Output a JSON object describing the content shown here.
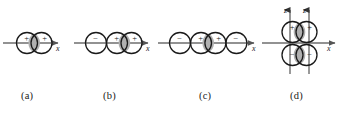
{
  "figure": {
    "background_color": "#ffffff",
    "stroke_color": "#1a1a1a",
    "axis_color": "#666666",
    "lens_fill_color": "#b3b3b3",
    "panels": [
      {
        "id": "a",
        "label": "(a)",
        "axes": [
          {
            "name": "x-axis",
            "label": "x",
            "direction": "right"
          }
        ],
        "lobes": [
          {
            "sign": "+",
            "position": "left"
          },
          {
            "sign": "+",
            "position": "right"
          }
        ],
        "overlap_regions": 1,
        "overlap_type": "bonding",
        "circle_count": 2
      },
      {
        "id": "b",
        "label": "(b)",
        "axes": [
          {
            "name": "x-axis",
            "label": "x",
            "direction": "right"
          }
        ],
        "lobes": [
          {
            "sign": "−",
            "position": "left"
          },
          {
            "sign": "+",
            "position": "center"
          },
          {
            "sign": "+",
            "position": "right"
          }
        ],
        "overlap_regions": 1,
        "overlap_type": "bonding",
        "circle_count": 3
      },
      {
        "id": "c",
        "label": "(c)",
        "axes": [
          {
            "name": "x-axis",
            "label": "x",
            "direction": "right"
          }
        ],
        "lobes": [
          {
            "sign": "−",
            "position": "far-left"
          },
          {
            "sign": "+",
            "position": "center-left"
          },
          {
            "sign": "+",
            "position": "center-right"
          },
          {
            "sign": "−",
            "position": "far-right"
          }
        ],
        "overlap_regions": 1,
        "overlap_type": "bonding",
        "circle_count": 4
      },
      {
        "id": "d",
        "label": "(d)",
        "axes": [
          {
            "name": "z-axis-left",
            "label": "z",
            "direction": "up"
          },
          {
            "name": "z-axis-right",
            "label": "z",
            "direction": "up"
          },
          {
            "name": "x-axis",
            "label": "x",
            "direction": "right"
          }
        ],
        "lobes": [
          {
            "sign": "+",
            "position": "top-left"
          },
          {
            "sign": "+",
            "position": "top-right"
          },
          {
            "sign": "−",
            "position": "bottom-left"
          },
          {
            "sign": "−",
            "position": "bottom-right"
          }
        ],
        "overlap_regions": 2,
        "overlap_type": "pi",
        "circle_count": 4
      }
    ]
  },
  "symbols": {
    "plus": "+",
    "minus": "−",
    "axis_x": "x",
    "axis_z": "z"
  }
}
